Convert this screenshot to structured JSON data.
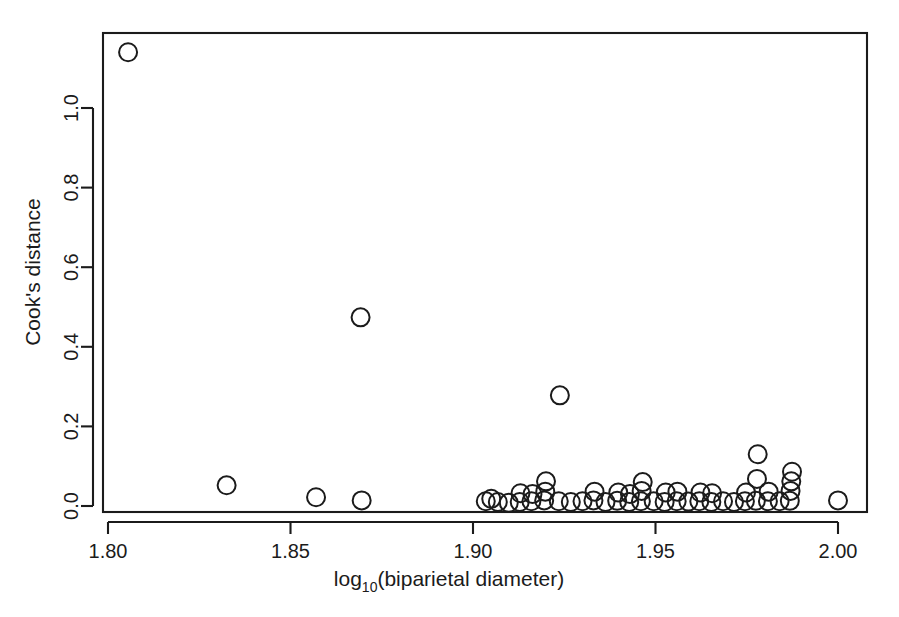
{
  "figure": {
    "background_color": "#ffffff",
    "ink_color": "#1b1b1b",
    "width": 899,
    "height": 617
  },
  "axes": {
    "x_title_main": "log",
    "x_title_sub": "10",
    "x_title_rest": "(biparietal diameter)",
    "y_title": "Cook's distance",
    "x_tick_labels": [
      "1.80",
      "1.85",
      "1.90",
      "1.95",
      "2.00"
    ],
    "y_tick_labels": [
      "0.0",
      "0.2",
      "0.4",
      "0.6",
      "0.8",
      "1.0"
    ]
  },
  "chart_data": {
    "type": "scatter",
    "title": "",
    "xlabel": "log10(biparietal diameter)",
    "ylabel": "Cook's distance",
    "xlim": [
      1.798,
      2.002
    ],
    "ylim": [
      -0.015,
      1.19
    ],
    "xticks": [
      1.8,
      1.85,
      1.9,
      1.95,
      2.0
    ],
    "yticks": [
      0.0,
      0.2,
      0.4,
      0.6,
      0.8,
      1.0
    ],
    "grid": false,
    "legend": null,
    "marker": "open-circle",
    "marker_radius_px": 9,
    "points": [
      {
        "x": 1.8055,
        "y": 1.14
      },
      {
        "x": 1.8325,
        "y": 0.052
      },
      {
        "x": 1.857,
        "y": 0.022
      },
      {
        "x": 1.8692,
        "y": 0.474
      },
      {
        "x": 1.8695,
        "y": 0.014
      },
      {
        "x": 1.9035,
        "y": 0.012
      },
      {
        "x": 1.905,
        "y": 0.018
      },
      {
        "x": 1.9068,
        "y": 0.01
      },
      {
        "x": 1.9098,
        "y": 0.008
      },
      {
        "x": 1.9128,
        "y": 0.01
      },
      {
        "x": 1.913,
        "y": 0.032
      },
      {
        "x": 1.916,
        "y": 0.012
      },
      {
        "x": 1.9163,
        "y": 0.03
      },
      {
        "x": 1.9195,
        "y": 0.014
      },
      {
        "x": 1.9198,
        "y": 0.036
      },
      {
        "x": 1.92,
        "y": 0.062
      },
      {
        "x": 1.9235,
        "y": 0.012
      },
      {
        "x": 1.9238,
        "y": 0.278
      },
      {
        "x": 1.9268,
        "y": 0.01
      },
      {
        "x": 1.93,
        "y": 0.012
      },
      {
        "x": 1.933,
        "y": 0.014
      },
      {
        "x": 1.9333,
        "y": 0.036
      },
      {
        "x": 1.9363,
        "y": 0.01
      },
      {
        "x": 1.9395,
        "y": 0.013
      },
      {
        "x": 1.9398,
        "y": 0.034
      },
      {
        "x": 1.9428,
        "y": 0.01
      },
      {
        "x": 1.943,
        "y": 0.03
      },
      {
        "x": 1.946,
        "y": 0.012
      },
      {
        "x": 1.9462,
        "y": 0.038
      },
      {
        "x": 1.9465,
        "y": 0.06
      },
      {
        "x": 1.9495,
        "y": 0.012
      },
      {
        "x": 1.9525,
        "y": 0.01
      },
      {
        "x": 1.9528,
        "y": 0.034
      },
      {
        "x": 1.9558,
        "y": 0.012
      },
      {
        "x": 1.956,
        "y": 0.036
      },
      {
        "x": 1.959,
        "y": 0.011
      },
      {
        "x": 1.962,
        "y": 0.012
      },
      {
        "x": 1.9623,
        "y": 0.034
      },
      {
        "x": 1.9653,
        "y": 0.01
      },
      {
        "x": 1.9655,
        "y": 0.032
      },
      {
        "x": 1.9685,
        "y": 0.012
      },
      {
        "x": 1.9715,
        "y": 0.01
      },
      {
        "x": 1.9745,
        "y": 0.012
      },
      {
        "x": 1.9748,
        "y": 0.034
      },
      {
        "x": 1.9775,
        "y": 0.013
      },
      {
        "x": 1.9778,
        "y": 0.068
      },
      {
        "x": 1.978,
        "y": 0.13
      },
      {
        "x": 1.9808,
        "y": 0.012
      },
      {
        "x": 1.981,
        "y": 0.036
      },
      {
        "x": 1.984,
        "y": 0.012
      },
      {
        "x": 1.9868,
        "y": 0.013
      },
      {
        "x": 1.987,
        "y": 0.038
      },
      {
        "x": 1.9872,
        "y": 0.062
      },
      {
        "x": 1.9874,
        "y": 0.086
      },
      {
        "x": 2.0,
        "y": 0.014
      }
    ]
  },
  "caption_fragment": ""
}
